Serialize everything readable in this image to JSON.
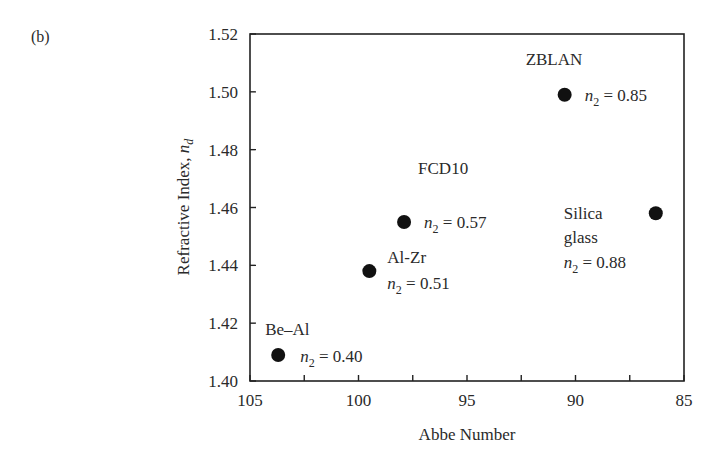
{
  "chart_data": {
    "type": "scatter",
    "panel_label": "(b)",
    "title": "",
    "xlabel": "Abbe Number",
    "ylabel": "Refractive Index, n_d",
    "ylabel_main": "Refractive Index, ",
    "ylabel_symbol": "n",
    "ylabel_sub": "d",
    "xlim": [
      105,
      85
    ],
    "x_reversed": true,
    "ylim": [
      1.4,
      1.52
    ],
    "xticks": [
      105,
      100,
      95,
      90,
      85
    ],
    "xtick_labels": [
      "105",
      "100",
      "95",
      "90",
      "85"
    ],
    "xminor_ticks": [
      102.5,
      97.5,
      92.5,
      87.5
    ],
    "yticks": [
      1.4,
      1.42,
      1.44,
      1.46,
      1.48,
      1.5,
      1.52
    ],
    "ytick_labels": [
      "1.40",
      "1.42",
      "1.44",
      "1.46",
      "1.48",
      "1.50",
      "1.52"
    ],
    "grid": false,
    "legend": "none",
    "points": [
      {
        "name": "Be–Al",
        "x": 103.7,
        "y": 1.409,
        "n2": "0.40",
        "annotation": "n2 = 0.40"
      },
      {
        "name": "Al-Zr",
        "x": 99.5,
        "y": 1.438,
        "n2": "0.51",
        "annotation": "n2 = 0.51"
      },
      {
        "name": "FCD10",
        "x": 97.9,
        "y": 1.455,
        "n2": "0.57",
        "annotation": "n2 = 0.57"
      },
      {
        "name": "ZBLAN",
        "x": 90.5,
        "y": 1.499,
        "n2": "0.85",
        "annotation": "n2 = 0.85"
      },
      {
        "name": "Silica glass",
        "x": 86.3,
        "y": 1.458,
        "n2": "0.88",
        "annotation": "n2 = 0.88"
      }
    ],
    "marker_color": "#111111"
  }
}
